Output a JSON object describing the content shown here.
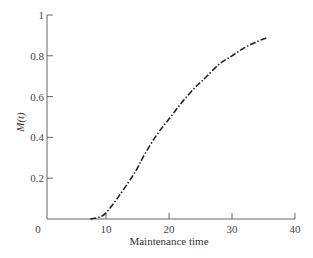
{
  "chart_data": {
    "type": "line",
    "title": "",
    "xlabel": "Maintenance time",
    "ylabel": "M(t)",
    "xlim": [
      0,
      40
    ],
    "ylim": [
      0,
      1
    ],
    "grid": false,
    "legend": null,
    "x_ticks": [
      "0",
      "10",
      "20",
      "30",
      "40"
    ],
    "y_ticks": [
      "0.2",
      "0.4",
      "0.6",
      "0.8",
      "1"
    ],
    "origin_label": "0",
    "series": [
      {
        "name": "M(t)",
        "line_style": "dash-dot",
        "color": "#222222",
        "x": [
          7.5,
          9,
          10,
          12,
          14,
          15,
          16,
          18,
          20,
          22,
          24,
          25,
          26,
          28,
          30,
          32,
          34,
          35.7
        ],
        "y": [
          0.0,
          0.01,
          0.03,
          0.11,
          0.2,
          0.25,
          0.31,
          0.41,
          0.49,
          0.57,
          0.64,
          0.67,
          0.7,
          0.76,
          0.8,
          0.84,
          0.87,
          0.89
        ]
      }
    ]
  }
}
